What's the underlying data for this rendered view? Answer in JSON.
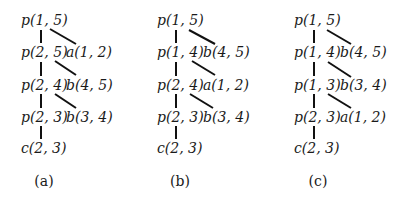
{
  "panels": [
    {
      "caption": "(a)",
      "spine": [
        "p(1, 5)",
        "p(2, 5)",
        "p(2, 4)",
        "p(2, 3)",
        "c(2, 3)"
      ],
      "branches": [
        "a(1, 2)",
        "b(4, 5)",
        "b(3, 4)"
      ]
    },
    {
      "caption": "(b)",
      "spine": [
        "p(1, 5)",
        "p(1, 4)",
        "p(2, 4)",
        "p(2, 3)",
        "c(2, 3)"
      ],
      "branches": [
        "b(4, 5)",
        "a(1, 2)",
        "b(3, 4)"
      ]
    },
    {
      "caption": "(c)",
      "spine": [
        "p(1, 5)",
        "p(1, 4)",
        "p(1, 3)",
        "p(2, 3)",
        "c(2, 3)"
      ],
      "branches": [
        "b(4, 5)",
        "b(3, 4)",
        "a(1, 2)"
      ]
    }
  ]
}
